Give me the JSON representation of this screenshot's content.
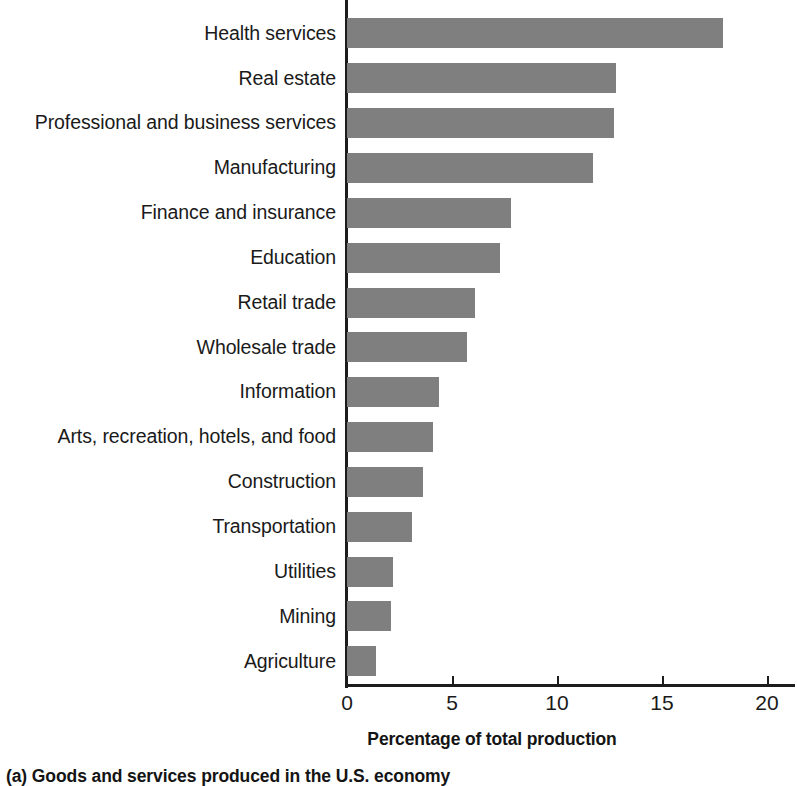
{
  "chart_data": {
    "type": "bar",
    "orientation": "horizontal",
    "title": "",
    "xlabel": "Percentage of total production",
    "ylabel": "",
    "xlim": [
      0,
      21.5
    ],
    "xticks": [
      "0",
      "5",
      "10",
      "15",
      "20"
    ],
    "xtick_values": [
      0,
      5,
      10,
      15,
      20
    ],
    "grid": false,
    "legend": null,
    "bar_color": "#7f7f7f",
    "axis_color": "#1c1c1c",
    "categories": [
      "Health services",
      "Real estate",
      "Professional and business services",
      "Manufacturing",
      "Finance and insurance",
      "Education",
      "Retail trade",
      "Wholesale trade",
      "Information",
      "Arts, recreation, hotels, and food",
      "Construction",
      "Transportation",
      "Utilities",
      "Mining",
      "Agriculture"
    ],
    "values": [
      17.9,
      12.8,
      12.7,
      11.7,
      7.8,
      7.3,
      6.1,
      5.7,
      4.4,
      4.1,
      3.6,
      3.1,
      2.2,
      2.1,
      1.4
    ]
  },
  "caption": {
    "text": "(a) Goods and services produced in the U.S. economy"
  }
}
